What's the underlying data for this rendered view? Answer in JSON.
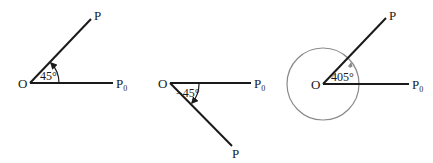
{
  "diagrams": [
    {
      "id": "positive-angle",
      "origin_label": "O",
      "initial_label": "P",
      "initial_subscript": "0",
      "terminal_label": "P",
      "angle_label": "45°",
      "angle_degrees": 45,
      "direction": "counterclockwise"
    },
    {
      "id": "negative-angle",
      "origin_label": "O",
      "initial_label": "P",
      "initial_subscript": "0",
      "terminal_label": "P",
      "angle_label": "−45°",
      "angle_degrees": -45,
      "direction": "clockwise"
    },
    {
      "id": "full-rotation-angle",
      "origin_label": "O",
      "initial_label": "P",
      "initial_subscript": "0",
      "terminal_label": "P",
      "angle_label": "405°",
      "angle_degrees": 405,
      "direction": "counterclockwise"
    }
  ],
  "colors": {
    "ray": "#1a1a1a",
    "rotation_circle": "#8a8a8a"
  }
}
